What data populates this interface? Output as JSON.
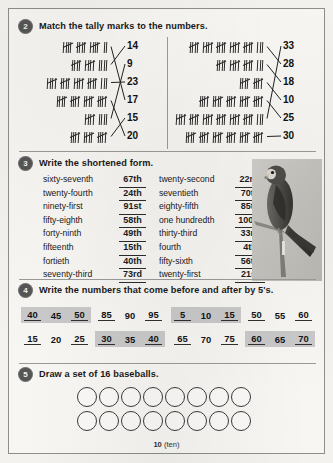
{
  "page": {
    "footer_number": "10",
    "footer_word": "(ten)"
  },
  "sections": [
    {
      "number": "2",
      "title": "Match the tally marks to the numbers.",
      "left_panel": {
        "rows": [
          {
            "tally_total": 17,
            "groups": 3,
            "remainder": 2,
            "answer": 17
          },
          {
            "tally_total": 14,
            "groups": 2,
            "remainder": 4,
            "answer": 14
          },
          {
            "tally_total": 23,
            "groups": 4,
            "remainder": 3,
            "answer": 23
          },
          {
            "tally_total": 20,
            "groups": 4,
            "remainder": 0,
            "answer": 20
          },
          {
            "tally_total": 9,
            "groups": 1,
            "remainder": 4,
            "answer": 9
          },
          {
            "tally_total": 15,
            "groups": 3,
            "remainder": 0,
            "answer": 15
          }
        ],
        "numbers": [
          "14",
          "9",
          "23",
          "17",
          "15",
          "20"
        ]
      },
      "right_panel": {
        "rows": [
          {
            "tally_total": 28,
            "groups": 5,
            "remainder": 3,
            "answer": 28
          },
          {
            "tally_total": 18,
            "groups": 3,
            "remainder": 3,
            "answer": 18
          },
          {
            "tally_total": 10,
            "groups": 2,
            "remainder": 0,
            "answer": 10
          },
          {
            "tally_total": 25,
            "groups": 5,
            "remainder": 0,
            "answer": 25
          },
          {
            "tally_total": 33,
            "groups": 6,
            "remainder": 3,
            "answer": 33
          },
          {
            "tally_total": 30,
            "groups": 6,
            "remainder": 0,
            "answer": 30
          }
        ],
        "numbers": [
          "33",
          "28",
          "18",
          "10",
          "25",
          "30"
        ]
      }
    },
    {
      "number": "3",
      "title": "Write the shortened form.",
      "left_column": [
        {
          "word": "sixty-seventh",
          "answer": "67th"
        },
        {
          "word": "twenty-fourth",
          "answer": "24th"
        },
        {
          "word": "ninety-first",
          "answer": "91st"
        },
        {
          "word": "fifty-eighth",
          "answer": "58th"
        },
        {
          "word": "forty-ninth",
          "answer": "49th"
        },
        {
          "word": "fifteenth",
          "answer": "15th"
        },
        {
          "word": "fortieth",
          "answer": "40th"
        },
        {
          "word": "seventy-third",
          "answer": "73rd"
        }
      ],
      "right_column": [
        {
          "word": "twenty-second",
          "answer": "22nd"
        },
        {
          "word": "seventieth",
          "answer": "70th"
        },
        {
          "word": "eighty-fifth",
          "answer": "85th"
        },
        {
          "word": "one hundredth",
          "answer": "100th"
        },
        {
          "word": "thirty-third",
          "answer": "33rd"
        },
        {
          "word": "fourth",
          "answer": "4th"
        },
        {
          "word": "fifty-sixth",
          "answer": "56th"
        },
        {
          "word": "twenty-first",
          "answer": "21st"
        }
      ]
    },
    {
      "number": "4",
      "title": "Write the numbers that come before and after by 5's.",
      "sequences": [
        {
          "before": "40",
          "given": "45",
          "after": "50",
          "shaded": true
        },
        {
          "before": "85",
          "given": "90",
          "after": "95",
          "shaded": false
        },
        {
          "before": "5",
          "given": "10",
          "after": "15",
          "shaded": true
        },
        {
          "before": "50",
          "given": "55",
          "after": "60",
          "shaded": false
        },
        {
          "before": "15",
          "given": "20",
          "after": "25",
          "shaded": false
        },
        {
          "before": "30",
          "given": "35",
          "after": "40",
          "shaded": true
        },
        {
          "before": "65",
          "given": "70",
          "after": "75",
          "shaded": false
        },
        {
          "before": "60",
          "given": "65",
          "after": "70",
          "shaded": true
        }
      ]
    },
    {
      "number": "5",
      "title": "Draw a set of 16 baseballs.",
      "ball_count": 16,
      "rows": [
        8,
        8
      ]
    }
  ],
  "illustration": {
    "name": "parrot-photo",
    "description": "parrot perched on branch"
  }
}
